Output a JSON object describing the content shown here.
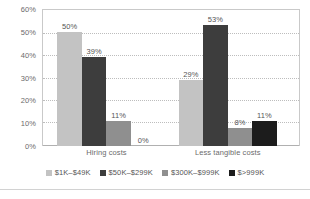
{
  "chart_data": {
    "type": "bar",
    "title": "",
    "subtitle": "",
    "xlabel": "",
    "ylabel": "",
    "ylim": [
      0,
      60
    ],
    "ytick_labels": [
      "60%",
      "50%",
      "40%",
      "30%",
      "20%",
      "10%",
      "0%"
    ],
    "ytick_values": [
      60,
      50,
      40,
      30,
      20,
      10,
      0
    ],
    "grid": true,
    "legend_position": "bottom",
    "categories": [
      "Hiring costs",
      "Less tangible costs"
    ],
    "series": [
      {
        "name": "$1K–$49K",
        "color": "#c3c3c3",
        "values": [
          50,
          29
        ],
        "labels": [
          "50%",
          "29%"
        ]
      },
      {
        "name": "$50K–$299K",
        "color": "#3d3d3d",
        "values": [
          39,
          53
        ],
        "labels": [
          "39%",
          "53%"
        ]
      },
      {
        "name": "$300K–$999K",
        "color": "#8f8f8f",
        "values": [
          11,
          8
        ],
        "labels": [
          "11%",
          "8%"
        ]
      },
      {
        "name": "$>999K",
        "color": "#1c1c1c",
        "values": [
          0,
          11
        ],
        "labels": [
          "0%",
          "11%"
        ]
      }
    ]
  },
  "legend": {
    "items": [
      {
        "label": "$1K–$49K",
        "color": "#c3c3c3"
      },
      {
        "label": "$50K–$299K",
        "color": "#3d3d3d"
      },
      {
        "label": "$300K–$999K",
        "color": "#8f8f8f"
      },
      {
        "label": "$>999K",
        "color": "#1c1c1c"
      }
    ]
  },
  "axes": {
    "y_ticks": [
      "60%",
      "50%",
      "40%",
      "30%",
      "20%",
      "10%",
      "0%"
    ],
    "x_categories": [
      "Hiring costs",
      "Less tangible costs"
    ]
  }
}
